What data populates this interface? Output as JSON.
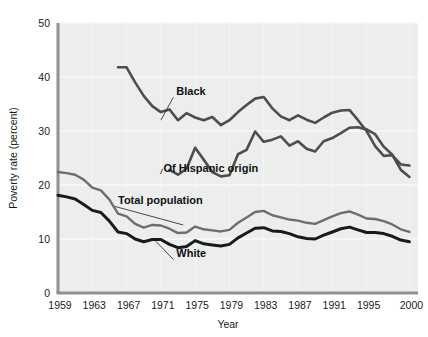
{
  "chart_data": {
    "type": "line",
    "title": "",
    "xlabel": "Year",
    "ylabel": "Poverty rate (percent)",
    "xlim": [
      1959,
      2001
    ],
    "ylim": [
      0,
      50
    ],
    "grid": false,
    "legend_position": "inline-annotations",
    "x_tick_labels": [
      "1959",
      "1963",
      "1967",
      "1971",
      "1975",
      "1979",
      "1983",
      "1987",
      "1991",
      "1995",
      "2000"
    ],
    "x_tick_values": [
      1959,
      1963,
      1967,
      1971,
      1975,
      1979,
      1983,
      1987,
      1991,
      1995,
      2000
    ],
    "y_tick_labels": [
      "0",
      "10",
      "20",
      "30",
      "40",
      "50"
    ],
    "y_tick_values": [
      0,
      10,
      20,
      30,
      40,
      50
    ],
    "series": [
      {
        "name": "Black",
        "label": "Black",
        "color": "#4d4d4d",
        "stroke_width": 2.6,
        "x": [
          1966,
          1967,
          1968,
          1969,
          1970,
          1971,
          1972,
          1973,
          1974,
          1975,
          1976,
          1977,
          1978,
          1979,
          1980,
          1981,
          1982,
          1983,
          1984,
          1985,
          1986,
          1987,
          1988,
          1989,
          1990,
          1991,
          1992,
          1993,
          1994,
          1995,
          1996,
          1997,
          1998,
          1999,
          2000
        ],
        "values": [
          41.8,
          41.8,
          39.0,
          36.5,
          34.6,
          33.5,
          34.0,
          32.0,
          33.3,
          32.5,
          32.0,
          32.6,
          31.1,
          32.0,
          33.5,
          34.8,
          36.0,
          36.3,
          34.2,
          32.7,
          32.0,
          32.9,
          32.1,
          31.5,
          32.5,
          33.4,
          33.8,
          33.9,
          32.0,
          30.0,
          27.2,
          25.4,
          25.5,
          23.8,
          23.6
        ]
      },
      {
        "name": "Of Hispanic origin",
        "label": "Of Hispanic origin",
        "color": "#4d4d4d",
        "stroke_width": 2.6,
        "x": [
          1972,
          1973,
          1974,
          1975,
          1976,
          1977,
          1978,
          1979,
          1980,
          1981,
          1982,
          1983,
          1984,
          1985,
          1986,
          1987,
          1988,
          1989,
          1990,
          1991,
          1992,
          1993,
          1994,
          1995,
          1996,
          1997,
          1998,
          1999,
          2000
        ],
        "values": [
          22.8,
          21.9,
          23.0,
          26.9,
          24.7,
          22.4,
          21.6,
          21.8,
          25.7,
          26.5,
          29.9,
          28.0,
          28.4,
          29.0,
          27.3,
          28.1,
          26.7,
          26.2,
          28.1,
          28.7,
          29.6,
          30.6,
          30.7,
          30.3,
          29.4,
          27.1,
          25.6,
          22.8,
          21.5
        ]
      },
      {
        "name": "Total population",
        "label": "Total population",
        "color": "#6e6e6e",
        "stroke_width": 2.4,
        "x": [
          1959,
          1960,
          1961,
          1962,
          1963,
          1964,
          1965,
          1966,
          1967,
          1968,
          1969,
          1970,
          1971,
          1972,
          1973,
          1974,
          1975,
          1976,
          1977,
          1978,
          1979,
          1980,
          1981,
          1982,
          1983,
          1984,
          1985,
          1986,
          1987,
          1988,
          1989,
          1990,
          1991,
          1992,
          1993,
          1994,
          1995,
          1996,
          1997,
          1998,
          1999,
          2000
        ],
        "values": [
          22.4,
          22.2,
          21.9,
          21.0,
          19.5,
          19.0,
          17.3,
          14.7,
          14.2,
          12.8,
          12.1,
          12.6,
          12.5,
          11.9,
          11.1,
          11.2,
          12.3,
          11.8,
          11.6,
          11.4,
          11.7,
          13.0,
          14.0,
          15.0,
          15.2,
          14.4,
          14.0,
          13.6,
          13.4,
          13.0,
          12.8,
          13.5,
          14.2,
          14.8,
          15.1,
          14.5,
          13.8,
          13.7,
          13.3,
          12.7,
          11.8,
          11.3
        ]
      },
      {
        "name": "White",
        "label": "White",
        "color": "#1a1a1a",
        "stroke_width": 3.0,
        "x": [
          1959,
          1960,
          1961,
          1962,
          1963,
          1964,
          1965,
          1966,
          1967,
          1968,
          1969,
          1970,
          1971,
          1972,
          1973,
          1974,
          1975,
          1976,
          1977,
          1978,
          1979,
          1980,
          1981,
          1982,
          1983,
          1984,
          1985,
          1986,
          1987,
          1988,
          1989,
          1990,
          1991,
          1992,
          1993,
          1994,
          1995,
          1996,
          1997,
          1998,
          1999,
          2000
        ],
        "values": [
          18.1,
          17.8,
          17.4,
          16.4,
          15.3,
          14.9,
          13.3,
          11.3,
          11.0,
          10.0,
          9.5,
          9.9,
          9.9,
          9.0,
          8.4,
          8.6,
          9.7,
          9.1,
          8.9,
          8.7,
          9.0,
          10.2,
          11.1,
          12.0,
          12.1,
          11.5,
          11.4,
          11.0,
          10.4,
          10.1,
          10.0,
          10.7,
          11.3,
          11.9,
          12.2,
          11.7,
          11.2,
          11.2,
          11.0,
          10.5,
          9.8,
          9.5
        ]
      }
    ],
    "annotations": [
      {
        "text": "Black",
        "x": 1972.8,
        "y": 36.6,
        "leader_to_x": 1971.0,
        "leader_to_y": 32.0
      },
      {
        "text": "Of Hispanic origin",
        "x": 1971.3,
        "y": 22.4,
        "leader_to_x": 1971.2,
        "leader_to_y": 23.0
      },
      {
        "text": "Total population",
        "x": 1966.0,
        "y": 16.4,
        "leader_to_x": 1973.6,
        "leader_to_y": 12.6
      },
      {
        "text": "White",
        "x": 1972.8,
        "y": 6.6,
        "leader_to_x": 1970.4,
        "leader_to_y": 9.6
      }
    ],
    "colors": {
      "plot_background": "#eceded",
      "axis": "#8f9092",
      "black_series": "#4d4d4d",
      "hispanic_series": "#4d4d4d",
      "total_series": "#6e6e6e",
      "white_series": "#1a1a1a",
      "text": "#1b1b1b",
      "page_background": "#ffffff"
    }
  }
}
